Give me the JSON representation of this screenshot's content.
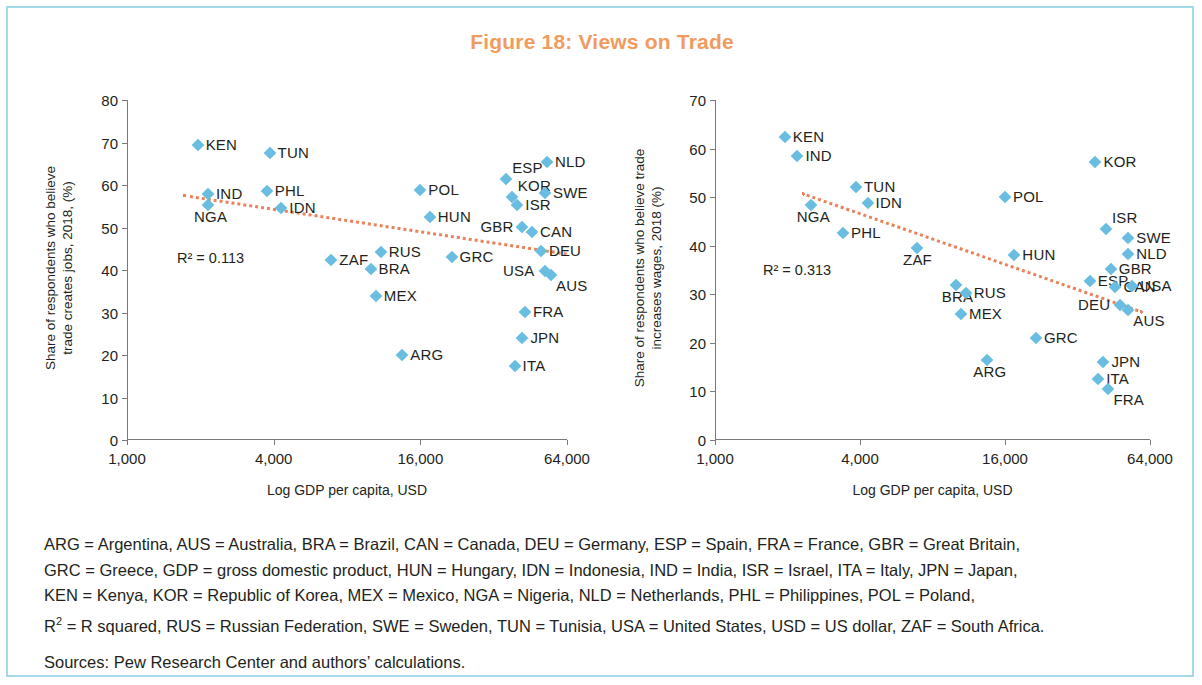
{
  "figure": {
    "title": "Figure 18: Views on Trade",
    "title_color": "#f19b5e",
    "marker_color": "#68bde0",
    "trendline_color": "#e8825c",
    "border_color": "#a5d9e8"
  },
  "footnote": {
    "line1": "ARG = Argentina, AUS = Australia, BRA = Brazil, CAN = Canada, DEU = Germany, ESP = Spain, FRA = France, GBR = Great Britain,",
    "line2": "GRC = Greece, GDP = gross domestic product, HUN = Hungary, IDN = Indonesia, IND = India, ISR = Israel, ITA = Italy, JPN = Japan,",
    "line3": "KEN = Kenya, KOR = Republic of Korea, MEX = Mexico, NGA = Nigeria, NLD = Netherlands, PHL = Philippines, POL = Poland,",
    "line4_prefix": "R",
    "line4_sup": "2",
    "line4": " = R squared, RUS = Russian Federation, SWE = Sweden, TUN = Tunisia, USA = United States, USD = US dollar, ZAF = South Africa.",
    "sources": "Sources: Pew Research Center and authors’ calculations."
  },
  "chart_data": [
    {
      "type": "scatter",
      "panel": "left",
      "title": "",
      "xlabel": "Log GDP per capita, USD",
      "ylabel": "Share of respondents who believe trade creates jobs, 2018, (%)",
      "ylabel_line1": "Share of respondents who believe",
      "ylabel_line2": "trade creates jobs, (%)",
      "xscale": "log",
      "xticks": [
        1000,
        4000,
        16000,
        64000
      ],
      "xtick_labels": [
        "1,000",
        "4,000",
        "16,000",
        "64,000"
      ],
      "xlim": [
        1000,
        64000
      ],
      "yticks": [
        0,
        10,
        20,
        30,
        40,
        50,
        60,
        70,
        80
      ],
      "ylim": [
        0,
        80
      ],
      "grid": false,
      "legend": "none",
      "r2_label": "R² = 0.113",
      "r2_value": 0.113,
      "trendline": {
        "x_start": 1700,
        "y_start": 57.8,
        "x_end": 64000,
        "y_end": 44.0
      },
      "points": [
        {
          "code": "KEN",
          "x": 1950,
          "y": 69.5,
          "lab": "right"
        },
        {
          "code": "TUN",
          "x": 3850,
          "y": 67.5,
          "lab": "right"
        },
        {
          "code": "IND",
          "x": 2150,
          "y": 58.0,
          "lab": "right"
        },
        {
          "code": "PHL",
          "x": 3750,
          "y": 58.7,
          "lab": "right"
        },
        {
          "code": "NGA",
          "x": 2150,
          "y": 55.3,
          "lab": "below"
        },
        {
          "code": "IDN",
          "x": 4300,
          "y": 54.5,
          "lab": "right"
        },
        {
          "code": "NLD",
          "x": 53000,
          "y": 65.5,
          "lab": "right"
        },
        {
          "code": "ESP",
          "x": 36000,
          "y": 61.3,
          "lab": "above-right"
        },
        {
          "code": "POL",
          "x": 16000,
          "y": 58.8,
          "lab": "right"
        },
        {
          "code": "KOR",
          "x": 38000,
          "y": 57.2,
          "lab": "above-right"
        },
        {
          "code": "SWE",
          "x": 52000,
          "y": 58.2,
          "lab": "right"
        },
        {
          "code": "ISR",
          "x": 40000,
          "y": 55.2,
          "lab": "right"
        },
        {
          "code": "HUN",
          "x": 17500,
          "y": 52.5,
          "lab": "right"
        },
        {
          "code": "GBR",
          "x": 42000,
          "y": 50.2,
          "lab": "left"
        },
        {
          "code": "CAN",
          "x": 46000,
          "y": 49.0,
          "lab": "right"
        },
        {
          "code": "DEU",
          "x": 50000,
          "y": 44.5,
          "lab": "right"
        },
        {
          "code": "ZAF",
          "x": 6900,
          "y": 42.3,
          "lab": "right"
        },
        {
          "code": "RUS",
          "x": 11000,
          "y": 44.3,
          "lab": "right"
        },
        {
          "code": "GRC",
          "x": 21500,
          "y": 43.0,
          "lab": "right"
        },
        {
          "code": "BRA",
          "x": 10000,
          "y": 40.2,
          "lab": "right"
        },
        {
          "code": "USA",
          "x": 52000,
          "y": 39.8,
          "lab": "left"
        },
        {
          "code": "AUS",
          "x": 55000,
          "y": 38.8,
          "lab": "below-right"
        },
        {
          "code": "MEX",
          "x": 10500,
          "y": 33.8,
          "lab": "right"
        },
        {
          "code": "FRA",
          "x": 43000,
          "y": 30.2,
          "lab": "right"
        },
        {
          "code": "JPN",
          "x": 42000,
          "y": 24.0,
          "lab": "right"
        },
        {
          "code": "ARG",
          "x": 13500,
          "y": 20.0,
          "lab": "right"
        },
        {
          "code": "ITA",
          "x": 39000,
          "y": 17.3,
          "lab": "right"
        }
      ]
    },
    {
      "type": "scatter",
      "panel": "right",
      "title": "",
      "xlabel": "Log GDP per capita, USD",
      "ylabel": "Share of respondents who believe trade increases wages, 2018 (%)",
      "ylabel_line1": "Share of respondents who believe trade",
      "ylabel_line2": "increases wages, 2018 (%)",
      "xscale": "log",
      "xticks": [
        1000,
        4000,
        16000,
        64000
      ],
      "xtick_labels": [
        "1,000",
        "4,000",
        "16,000",
        "64,000"
      ],
      "xlim": [
        1000,
        64000
      ],
      "yticks": [
        0,
        10,
        20,
        30,
        40,
        50,
        60,
        70
      ],
      "ylim": [
        0,
        70
      ],
      "grid": false,
      "legend": "none",
      "r2_label": "R² = 0.313",
      "r2_value": 0.313,
      "trendline": {
        "x_start": 2300,
        "y_start": 51.0,
        "x_end": 60000,
        "y_end": 26.5
      },
      "points": [
        {
          "code": "KEN",
          "x": 1950,
          "y": 62.4,
          "lab": "right"
        },
        {
          "code": "IND",
          "x": 2200,
          "y": 58.4,
          "lab": "right"
        },
        {
          "code": "TUN",
          "x": 3850,
          "y": 52.0,
          "lab": "right"
        },
        {
          "code": "IDN",
          "x": 4300,
          "y": 48.7,
          "lab": "right"
        },
        {
          "code": "NGA",
          "x": 2500,
          "y": 48.3,
          "lab": "below"
        },
        {
          "code": "PHL",
          "x": 3400,
          "y": 42.7,
          "lab": "right"
        },
        {
          "code": "POL",
          "x": 16000,
          "y": 50.0,
          "lab": "right"
        },
        {
          "code": "KOR",
          "x": 38000,
          "y": 57.2,
          "lab": "right"
        },
        {
          "code": "ZAF",
          "x": 6900,
          "y": 39.5,
          "lab": "below"
        },
        {
          "code": "HUN",
          "x": 17500,
          "y": 38.0,
          "lab": "right"
        },
        {
          "code": "ISR",
          "x": 42000,
          "y": 43.4,
          "lab": "above-right"
        },
        {
          "code": "SWE",
          "x": 52000,
          "y": 41.5,
          "lab": "right"
        },
        {
          "code": "NLD",
          "x": 52000,
          "y": 38.3,
          "lab": "right"
        },
        {
          "code": "GBR",
          "x": 44000,
          "y": 35.2,
          "lab": "right"
        },
        {
          "code": "BRA",
          "x": 10000,
          "y": 32.0,
          "lab": "below"
        },
        {
          "code": "RUS",
          "x": 11000,
          "y": 30.2,
          "lab": "right"
        },
        {
          "code": "ESP",
          "x": 36000,
          "y": 32.7,
          "lab": "right"
        },
        {
          "code": "CAN",
          "x": 46000,
          "y": 31.4,
          "lab": "right"
        },
        {
          "code": "USA",
          "x": 54000,
          "y": 31.8,
          "lab": "right"
        },
        {
          "code": "DEU",
          "x": 48000,
          "y": 27.8,
          "lab": "left"
        },
        {
          "code": "AUS",
          "x": 52000,
          "y": 26.8,
          "lab": "below-right"
        },
        {
          "code": "MEX",
          "x": 10500,
          "y": 26.0,
          "lab": "right"
        },
        {
          "code": "GRC",
          "x": 21500,
          "y": 20.9,
          "lab": "right"
        },
        {
          "code": "ARG",
          "x": 13500,
          "y": 16.4,
          "lab": "below"
        },
        {
          "code": "JPN",
          "x": 41000,
          "y": 16.0,
          "lab": "right"
        },
        {
          "code": "ITA",
          "x": 39000,
          "y": 12.6,
          "lab": "right"
        },
        {
          "code": "FRA",
          "x": 43000,
          "y": 10.6,
          "lab": "below-right"
        }
      ]
    }
  ]
}
